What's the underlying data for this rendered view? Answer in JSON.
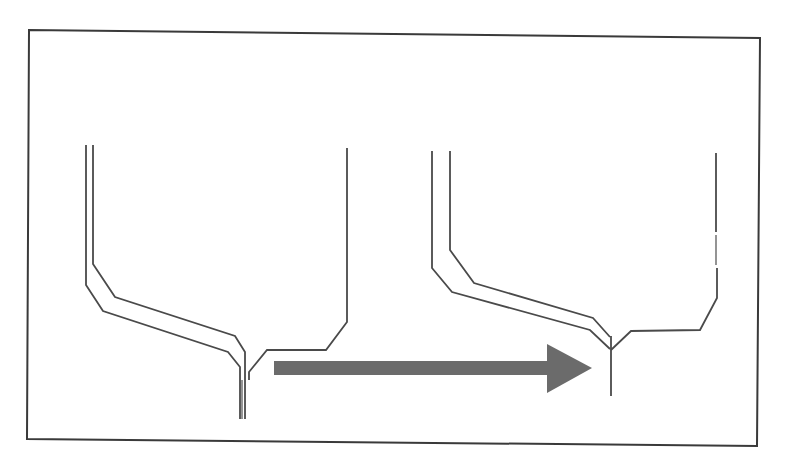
{
  "diagram": {
    "type": "before-after-transformation",
    "colors": {
      "background": "#ffffff",
      "frame": "#3a3a3a",
      "lines": "#4a4a4a",
      "arrow": "#6b6b6b"
    },
    "frame": {
      "x1": 29,
      "y1": 30,
      "x2": 760,
      "y2": 38,
      "x3": 757,
      "y3": 446,
      "x4": 27,
      "y4": 439
    },
    "left_funnel": {
      "outer_wall": "86,145 86,285 103,311 228,352 240,367 240,419",
      "inner_wall": "93,145 93,264 115,297 235,336 245,352 245,419",
      "nozzle_center": "242,380 242,419",
      "right_wall": "347,148 347,322 326,350 267,350 249,372 249,380"
    },
    "right_funnel": {
      "outer_wall": "432,151 432,268 452,292 590,330 610,349",
      "inner_wall": "450,151 450,250 474,283 593,318 610,337",
      "nozzle": "611,336 611,396",
      "right_wall_upper": "716,153 716,232",
      "right_wall_lower": "716,235 716,265",
      "right_wall_bottom": "717,268 717,298 700,330 631,331 611,350"
    },
    "arrow": {
      "shaft": {
        "x": 274,
        "y": 361,
        "width": 274,
        "height": 14
      },
      "head": "547,344 592,368 547,393",
      "direction": "right"
    }
  }
}
